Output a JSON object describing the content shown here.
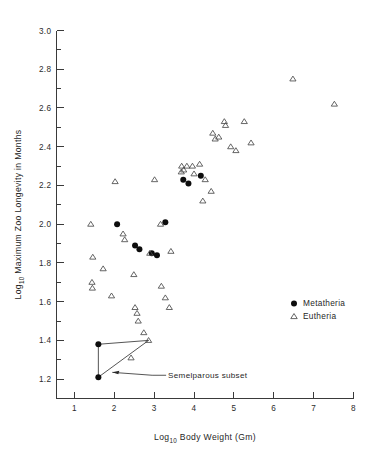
{
  "chart_data": {
    "type": "scatter",
    "title": "",
    "xlabel": "Log10 Body Weight (Gm)",
    "ylabel": "Log10 Maximum Zoo Longevity in Months",
    "xlabel_parts": {
      "main_a": "Log",
      "sub": "10",
      "main_b": " Body Weight (Gm)"
    },
    "ylabel_parts": {
      "main_a": "Log",
      "sub": "10",
      "main_b": " Maximum Zoo Longevity in Months"
    },
    "xlim": [
      0.55,
      8.0
    ],
    "ylim": [
      1.1,
      3.0
    ],
    "xticks": [
      1,
      2,
      3,
      4,
      5,
      6,
      7,
      8
    ],
    "xtick_labels": [
      "1",
      "2",
      "3",
      "4",
      "5",
      "6",
      "7",
      "8"
    ],
    "yticks": [
      1.2,
      1.4,
      1.6,
      1.8,
      2.0,
      2.2,
      2.4,
      2.6,
      2.8,
      3.0
    ],
    "ytick_labels": [
      "1.2",
      "1.4",
      "1.6",
      "1.8",
      "2.0",
      "2.2",
      "2.4",
      "2.6",
      "2.8",
      "3.0"
    ],
    "y_minor_step": 0.1,
    "grid": false,
    "legend_position": "right-middle",
    "colors": {
      "metatheria": "#0d0d0d",
      "eutheria": "#4a4a4a",
      "axis": "#3a3a3a"
    },
    "series": [
      {
        "name": "Metatheria",
        "marker": "filled-circle",
        "points": [
          [
            1.6,
            1.38
          ],
          [
            1.6,
            1.21
          ],
          [
            2.07,
            2.0
          ],
          [
            2.52,
            1.89
          ],
          [
            2.63,
            1.87
          ],
          [
            2.94,
            1.85
          ],
          [
            3.07,
            1.84
          ],
          [
            3.28,
            2.01
          ],
          [
            3.73,
            2.23
          ],
          [
            3.86,
            2.21
          ],
          [
            4.17,
            2.25
          ]
        ]
      },
      {
        "name": "Eutheria",
        "marker": "open-triangle",
        "points": [
          [
            1.41,
            2.0
          ],
          [
            1.46,
            1.83
          ],
          [
            1.44,
            1.7
          ],
          [
            1.45,
            1.67
          ],
          [
            1.72,
            1.77
          ],
          [
            1.93,
            1.63
          ],
          [
            2.02,
            2.22
          ],
          [
            2.22,
            1.95
          ],
          [
            2.26,
            1.92
          ],
          [
            2.42,
            1.31
          ],
          [
            2.49,
            1.74
          ],
          [
            2.52,
            1.57
          ],
          [
            2.57,
            1.54
          ],
          [
            2.6,
            1.5
          ],
          [
            2.74,
            1.44
          ],
          [
            2.86,
            1.4
          ],
          [
            2.89,
            1.85
          ],
          [
            3.01,
            2.23
          ],
          [
            3.16,
            2.0
          ],
          [
            3.18,
            1.68
          ],
          [
            3.28,
            1.62
          ],
          [
            3.38,
            1.57
          ],
          [
            3.42,
            1.86
          ],
          [
            3.68,
            2.27
          ],
          [
            3.69,
            2.3
          ],
          [
            3.74,
            2.28
          ],
          [
            3.82,
            2.3
          ],
          [
            3.96,
            2.3
          ],
          [
            4.0,
            2.26
          ],
          [
            4.14,
            2.31
          ],
          [
            4.22,
            2.12
          ],
          [
            4.28,
            2.23
          ],
          [
            4.43,
            2.17
          ],
          [
            4.47,
            2.47
          ],
          [
            4.53,
            2.44
          ],
          [
            4.62,
            2.45
          ],
          [
            4.76,
            2.53
          ],
          [
            4.79,
            2.51
          ],
          [
            4.92,
            2.4
          ],
          [
            5.05,
            2.38
          ],
          [
            5.26,
            2.53
          ],
          [
            5.43,
            2.42
          ],
          [
            6.48,
            2.75
          ],
          [
            7.52,
            2.62
          ]
        ]
      }
    ],
    "annotations": [
      {
        "type": "hull",
        "label": "Semelparous subset",
        "label_point": [
          3.35,
          1.22
        ],
        "leader_from": [
          3.3,
          1.22
        ],
        "leader_to": [
          1.95,
          1.235
        ],
        "vertices": [
          [
            1.6,
            1.38
          ],
          [
            2.86,
            1.4
          ],
          [
            1.6,
            1.21
          ],
          [
            1.6,
            1.38
          ]
        ],
        "member_points": [
          [
            1.6,
            1.38
          ],
          [
            2.86,
            1.4
          ],
          [
            2.42,
            1.31
          ],
          [
            1.6,
            1.21
          ]
        ]
      }
    ],
    "legend_entries": [
      {
        "label": "Metatheria",
        "marker": "filled-circle"
      },
      {
        "label": "Eutheria",
        "marker": "open-triangle"
      }
    ]
  }
}
